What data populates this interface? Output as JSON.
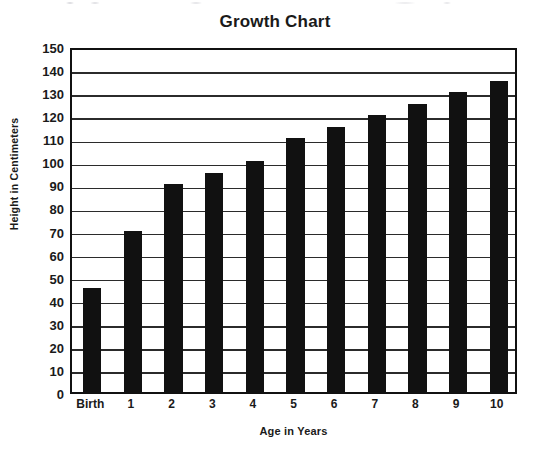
{
  "chart_data": {
    "type": "bar",
    "title": "Growth Chart",
    "xlabel": "Age in Years",
    "ylabel": "Height in Centimeters",
    "categories": [
      "Birth",
      "1",
      "2",
      "3",
      "4",
      "5",
      "6",
      "7",
      "8",
      "9",
      "10"
    ],
    "values": [
      45,
      70,
      90,
      95,
      100,
      110,
      115,
      120,
      125,
      130,
      135
    ],
    "ylim": [
      0,
      150
    ],
    "ytick_step": 10,
    "yticks": [
      150,
      140,
      130,
      120,
      110,
      100,
      90,
      80,
      70,
      60,
      50,
      40,
      30,
      20,
      10,
      0
    ],
    "ytick_labels": [
      "150",
      "140",
      "130",
      "120",
      "110",
      "100",
      "90",
      "80",
      "70",
      "60",
      "50",
      "40",
      "30",
      "20",
      "10",
      "0"
    ],
    "grid": true,
    "grid_axis": "y",
    "legend": false,
    "legend_position": "none",
    "bar_color": "#111111",
    "grid_color": "#2b2b2b",
    "frame_color": "#111111",
    "background_color": "#ffffff",
    "text_color": "#1a1a1a"
  }
}
